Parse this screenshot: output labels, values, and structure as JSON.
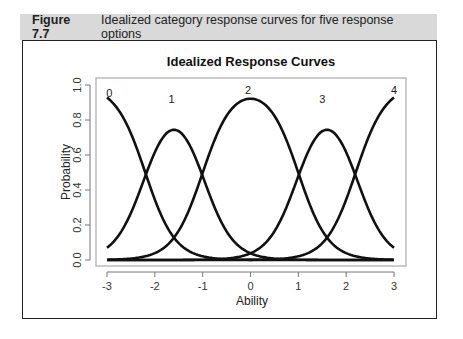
{
  "figure": {
    "number": "Figure 7.7",
    "caption": "Idealized category response curves for five response options"
  },
  "chart_data": {
    "type": "line",
    "title": "Idealized Response Curves",
    "xlabel": "Ability",
    "ylabel": "Probability",
    "xlim": [
      -3,
      3
    ],
    "ylim": [
      0,
      1
    ],
    "xticks": [
      -3,
      -2,
      -1,
      0,
      1,
      2,
      3
    ],
    "yticks": [
      0.0,
      0.2,
      0.4,
      0.6,
      0.8,
      1.0
    ],
    "ytick_labels": [
      "0.0",
      "0.2",
      "0.4",
      "0.6",
      "0.8",
      "1.0"
    ],
    "grid": false,
    "legend": "none (curves labeled inline 0-4)",
    "model": {
      "description": "Graded response category curves",
      "discrimination": 3.2,
      "thresholds": [
        -2.2,
        -1.0,
        1.0,
        2.2
      ]
    },
    "series": [
      {
        "name": "0",
        "label_pos": [
          -2.95,
          0.93
        ],
        "peak": {
          "x": -3,
          "y": 0.97
        }
      },
      {
        "name": "1",
        "label_pos": [
          -1.65,
          0.9
        ],
        "peak": {
          "x": -1.6,
          "y": 0.87
        }
      },
      {
        "name": "2",
        "label_pos": [
          -0.05,
          0.95
        ],
        "peak": {
          "x": 0,
          "y": 0.98
        }
      },
      {
        "name": "3",
        "label_pos": [
          1.5,
          0.9
        ],
        "peak": {
          "x": 1.6,
          "y": 0.87
        }
      },
      {
        "name": "4",
        "label_pos": [
          3.0,
          0.95
        ],
        "peak": {
          "x": 3,
          "y": 0.98
        }
      }
    ],
    "sampled_values": {
      "x": [
        -3,
        -2.2,
        -1.6,
        -1.0,
        0,
        1.0,
        1.6,
        2.2,
        3
      ],
      "cat0": [
        0.97,
        0.5,
        0.13,
        0.02,
        0.0,
        0.0,
        0.0,
        0.0,
        0.0
      ],
      "cat1": [
        0.03,
        0.48,
        0.87,
        0.5,
        0.04,
        0.0,
        0.0,
        0.0,
        0.0
      ],
      "cat2": [
        0.0,
        0.02,
        0.13,
        0.48,
        0.98,
        0.48,
        0.13,
        0.02,
        0.0
      ],
      "cat3": [
        0.0,
        0.0,
        0.0,
        0.0,
        0.04,
        0.5,
        0.87,
        0.48,
        0.03
      ],
      "cat4": [
        0.0,
        0.0,
        0.0,
        0.0,
        0.0,
        0.02,
        0.13,
        0.5,
        0.97
      ]
    }
  }
}
